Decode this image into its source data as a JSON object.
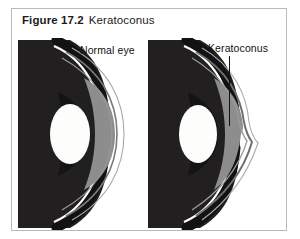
{
  "figure": {
    "number": "Figure 17.2",
    "title": "Keratoconus",
    "caption_full": "Figure 17.2  Keratoconus",
    "frame_color": "#b9b9b9",
    "background_color": "#ffffff"
  },
  "diagram": {
    "type": "medical-illustration",
    "panels": [
      {
        "id": "normal-eye",
        "label": "Normal eye",
        "description": "cross-section of a normal eye with a smoothly curved, dome-shaped cornea",
        "cornea_shape": "smooth-dome",
        "label_position": "top-right of panel"
      },
      {
        "id": "keratoconus-eye",
        "label": "Keratoconus",
        "description": "cross-section of an eye with keratoconus showing a cone-shaped bulging cornea",
        "cornea_shape": "cone-protrusion",
        "label_position": "top-right of panel",
        "has_leader_line": true
      }
    ],
    "anatomy_colors": {
      "sclera_body": "#221f20",
      "lens": "#fdfdfb",
      "anterior_chamber": "#8d8d8d",
      "cornea_outline": "#6f6f6f",
      "highlight": "#ffffff",
      "leader_line": "#111111"
    }
  }
}
